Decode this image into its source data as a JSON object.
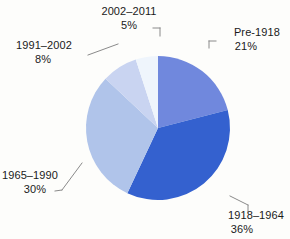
{
  "chart_data": {
    "type": "pie",
    "title": "",
    "subtitle": "",
    "xlabel": "",
    "ylabel": "",
    "legend_position": "none",
    "grid": false,
    "start_angle_deg": 0,
    "direction": "clockwise",
    "categories": [
      "Pre-1918",
      "1918–1964",
      "1965–1990",
      "1991–2002",
      "2002–2011"
    ],
    "values": [
      21,
      36,
      30,
      8,
      5
    ],
    "value_unit": "%",
    "value_labels": [
      "21%",
      "36%",
      "30%",
      "8%",
      "5%"
    ],
    "colors": [
      "#7088dd",
      "#3461cf",
      "#b0c4ea",
      "#c9d4f1",
      "#eff5fc"
    ],
    "slices": [
      {
        "label": "Pre-1918",
        "value": 21,
        "value_label": "21%",
        "color": "#7088dd",
        "start_deg": 0,
        "end_deg": 75.6
      },
      {
        "label": "1918–1964",
        "value": 36,
        "value_label": "36%",
        "color": "#3461cf",
        "start_deg": 75.6,
        "end_deg": 205.2
      },
      {
        "label": "1965–1990",
        "value": 30,
        "value_label": "30%",
        "color": "#b0c4ea",
        "start_deg": 205.2,
        "end_deg": 313.2
      },
      {
        "label": "1991–2002",
        "value": 8,
        "value_label": "8%",
        "color": "#c9d4f1",
        "start_deg": 313.2,
        "end_deg": 342.0
      },
      {
        "label": "2002–2011",
        "value": 5,
        "value_label": "5%",
        "color": "#eff5fc",
        "start_deg": 342.0,
        "end_deg": 360.0
      }
    ]
  },
  "labels": {
    "pre_1918": {
      "name": "Pre-1918",
      "pct": "21%"
    },
    "y1918_1964": {
      "name": "1918–1964",
      "pct": "36%"
    },
    "y1965_1990": {
      "name": "1965–1990",
      "pct": "30%"
    },
    "y1991_2002": {
      "name": "1991–2002",
      "pct": "8%"
    },
    "y2002_2011": {
      "name": "2002–2011",
      "pct": "5%"
    }
  },
  "style": {
    "background": "#fdfdfb",
    "text_color": "#1a1a1a",
    "leader_color": "#8a8a8a"
  }
}
